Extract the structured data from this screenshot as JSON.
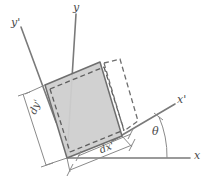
{
  "figure": {
    "kind": "mechanics-strain-element-diagram",
    "background_color": "#ffffff",
    "element_fill_color": "#cfcfcf",
    "line_color": "#6e6e6e",
    "axis_color": "#7a7a7a",
    "dimension_color": "#8a8a8a",
    "rotation_angle_degrees": 22
  },
  "axes": [
    {
      "id": "x",
      "label": "x",
      "label_x": 194,
      "label_y": 156
    },
    {
      "id": "y",
      "label": "y",
      "label_x": 73,
      "label_y": 2
    },
    {
      "id": "x-prime",
      "label": "x'",
      "label_x": 177,
      "label_y": 94
    },
    {
      "id": "y-prime",
      "label": "y'",
      "label_x": 11,
      "label_y": 17
    }
  ],
  "dimensions": [
    {
      "id": "dy-prime",
      "label": "dy'",
      "label_x": 30,
      "label_y": 116,
      "rotation_degrees": -68
    },
    {
      "id": "dx-prime",
      "label": "dx'",
      "label_x": 100,
      "label_y": 146,
      "rotation_degrees": -22
    }
  ],
  "angle": {
    "id": "theta",
    "label": "θ",
    "label_x": 152,
    "label_y": 128,
    "value_degrees": 22,
    "from_axis": "x",
    "to_axis": "x'"
  },
  "geometry": {
    "origin": {
      "x": 67,
      "y": 158
    },
    "element_corners": [
      {
        "x": 67,
        "y": 158
      },
      {
        "x": 122,
        "y": 136
      },
      {
        "x": 100,
        "y": 62
      },
      {
        "x": 45,
        "y": 85
      }
    ],
    "deformed_corners": [
      {
        "x": 72,
        "y": 154
      },
      {
        "x": 130,
        "y": 131
      },
      {
        "x": 116,
        "y": 65
      },
      {
        "x": 57,
        "y": 88
      }
    ]
  }
}
